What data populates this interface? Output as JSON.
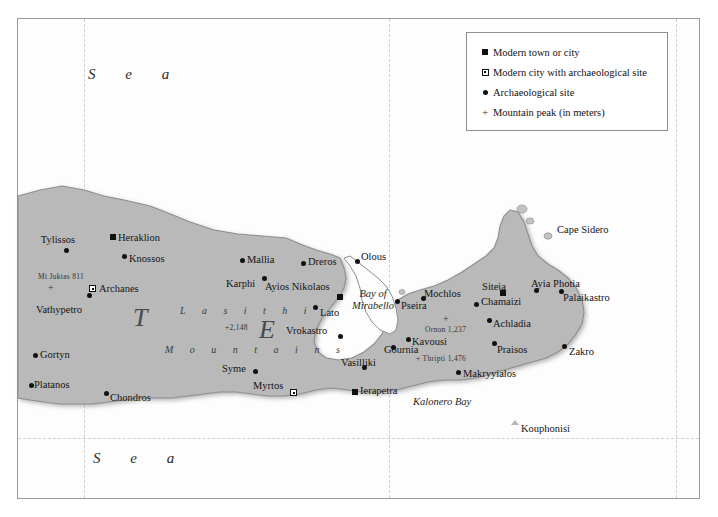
{
  "legend": {
    "items": [
      {
        "symbol": "filled-square",
        "label": "Modern town or city"
      },
      {
        "symbol": "square-with-dot",
        "label": "Modern city with archaeological site"
      },
      {
        "symbol": "filled-circle",
        "label": "Archaeological site"
      },
      {
        "symbol": "plus",
        "label": "Mountain peak (in meters)"
      }
    ]
  },
  "sea_labels": [
    {
      "text": "S e a",
      "x": 88,
      "y": 66
    },
    {
      "text": "S e a",
      "x": 93,
      "y": 450
    }
  ],
  "bay_labels": [
    {
      "text": "Bay of",
      "text2": "Mirabello",
      "x": 352,
      "y": 288
    },
    {
      "text": "Kalonero Bay",
      "x": 413,
      "y": 396
    }
  ],
  "big_letters": [
    {
      "text": "T",
      "x": 133,
      "y": 303
    },
    {
      "text": "E",
      "x": 259,
      "y": 315
    }
  ],
  "range_labels": [
    {
      "text": "L a s i t h i",
      "x": 180,
      "y": 305
    },
    {
      "text": "M o u n t a i n s",
      "x": 165,
      "y": 344
    }
  ],
  "places": [
    {
      "name": "Tylissos",
      "type": "filled-circle",
      "mx": 64,
      "my": 248,
      "lx": 58,
      "ly": 234,
      "align": "center"
    },
    {
      "name": "Heraklion",
      "type": "filled-square",
      "mx": 110,
      "my": 234,
      "lx": 118,
      "ly": 232,
      "align": "left"
    },
    {
      "name": "Knossos",
      "type": "filled-circle",
      "mx": 122,
      "my": 254,
      "lx": 129,
      "ly": 253,
      "align": "left"
    },
    {
      "name": "Archanes",
      "type": "square-with-dot",
      "mx": 89,
      "my": 285,
      "lx": 99,
      "ly": 283,
      "align": "left"
    },
    {
      "name": "Vathypetro",
      "type": "filled-circle",
      "mx": 87,
      "my": 293,
      "lx": 36,
      "ly": 304,
      "align": "left"
    },
    {
      "name": "Gortyn",
      "type": "filled-circle",
      "mx": 33,
      "my": 353,
      "lx": 40,
      "ly": 349,
      "align": "left"
    },
    {
      "name": "Platanos",
      "type": "filled-circle",
      "mx": 29,
      "my": 383,
      "lx": 34,
      "ly": 379,
      "align": "left"
    },
    {
      "name": "Chondros",
      "type": "filled-circle",
      "mx": 104,
      "my": 391,
      "lx": 110,
      "ly": 392,
      "align": "left"
    },
    {
      "name": "Mallia",
      "type": "filled-circle",
      "mx": 240,
      "my": 258,
      "lx": 247,
      "ly": 254,
      "align": "left"
    },
    {
      "name": "Dreros",
      "type": "filled-circle",
      "mx": 301,
      "my": 261,
      "lx": 308,
      "ly": 256,
      "align": "left"
    },
    {
      "name": "Olous",
      "type": "filled-circle",
      "mx": 355,
      "my": 259,
      "lx": 361,
      "ly": 251,
      "align": "left"
    },
    {
      "name": "Karphi",
      "type": "filled-circle",
      "mx": 262,
      "my": 276,
      "lx": 226,
      "ly": 278,
      "align": "left"
    },
    {
      "name": "Ayios Nikolaos",
      "type": "filled-square",
      "mx": 337,
      "my": 294,
      "lx": 265,
      "ly": 281,
      "align": "left"
    },
    {
      "name": "Lato",
      "type": "filled-circle",
      "mx": 313,
      "my": 305,
      "lx": 320,
      "ly": 307,
      "align": "left"
    },
    {
      "name": "Vrokastro",
      "type": "filled-circle",
      "mx": 338,
      "my": 334,
      "lx": 286,
      "ly": 325,
      "align": "left"
    },
    {
      "name": "Syme",
      "type": "filled-circle",
      "mx": 253,
      "my": 369,
      "lx": 222,
      "ly": 363,
      "align": "left"
    },
    {
      "name": "Myrtos",
      "type": "square-with-dot",
      "mx": 290,
      "my": 389,
      "lx": 253,
      "ly": 380,
      "align": "left"
    },
    {
      "name": "Vasilliki",
      "type": "filled-circle",
      "mx": 362,
      "my": 365,
      "lx": 341,
      "ly": 357,
      "align": "left"
    },
    {
      "name": "Ierapetra",
      "type": "filled-square",
      "mx": 352,
      "my": 389,
      "lx": 360,
      "ly": 385,
      "align": "left"
    },
    {
      "name": "Pseira",
      "type": "filled-circle",
      "mx": 395,
      "my": 299,
      "lx": 401,
      "ly": 300,
      "align": "left"
    },
    {
      "name": "Mochlos",
      "type": "filled-circle",
      "mx": 421,
      "my": 296,
      "lx": 424,
      "ly": 288,
      "align": "left"
    },
    {
      "name": "Gournia",
      "type": "filled-circle",
      "mx": 391,
      "my": 345,
      "lx": 384,
      "ly": 344,
      "align": "left"
    },
    {
      "name": "Kavousi",
      "type": "filled-circle",
      "mx": 406,
      "my": 337,
      "lx": 412,
      "ly": 336,
      "align": "left"
    },
    {
      "name": "Chamaizi",
      "type": "filled-circle",
      "mx": 474,
      "my": 302,
      "lx": 481,
      "ly": 296,
      "align": "left"
    },
    {
      "name": "Achladia",
      "type": "filled-circle",
      "mx": 487,
      "my": 318,
      "lx": 493,
      "ly": 318,
      "align": "left"
    },
    {
      "name": "Praisos",
      "type": "filled-circle",
      "mx": 492,
      "my": 341,
      "lx": 497,
      "ly": 344,
      "align": "left"
    },
    {
      "name": "Siteia",
      "type": "filled-square",
      "mx": 500,
      "my": 290,
      "lx": 494,
      "ly": 281,
      "align": "center"
    },
    {
      "name": "Ayia Photia",
      "type": "filled-circle",
      "mx": 534,
      "my": 288,
      "lx": 531,
      "ly": 278,
      "align": "left"
    },
    {
      "name": "Palaikastro",
      "type": "filled-circle",
      "mx": 559,
      "my": 289,
      "lx": 563,
      "ly": 292,
      "align": "left"
    },
    {
      "name": "Zakro",
      "type": "filled-circle",
      "mx": 562,
      "my": 344,
      "lx": 569,
      "ly": 346,
      "align": "left"
    },
    {
      "name": "Makryyialos",
      "type": "filled-circle",
      "mx": 456,
      "my": 370,
      "lx": 463,
      "ly": 368,
      "align": "left"
    }
  ],
  "peaks": [
    {
      "name": "Mt Juktas 811",
      "lx": 38,
      "ly": 272,
      "mx": 48,
      "my": 284
    },
    {
      "name": "+2,148",
      "lx": 225,
      "ly": 323,
      "mx": -1,
      "my": -1
    },
    {
      "name": "Ornon 1,237",
      "lx": 425,
      "ly": 325,
      "mx": 443,
      "my": 315
    },
    {
      "name": "+ Thripti 1,476",
      "lx": 416,
      "ly": 354,
      "mx": -1,
      "my": -1
    }
  ],
  "coast_labels": [
    {
      "name": "Cape Sidero",
      "lx": 557,
      "ly": 224
    },
    {
      "name": "Kouphonisi",
      "lx": 521,
      "ly": 423,
      "mx": 511,
      "my": 420
    }
  ],
  "colors": {
    "land": "#b9b9b9",
    "land_edge": "#8e8e8e",
    "sea": "#fdfdfd",
    "frame": "#9a9a9a",
    "text": "#141414"
  }
}
